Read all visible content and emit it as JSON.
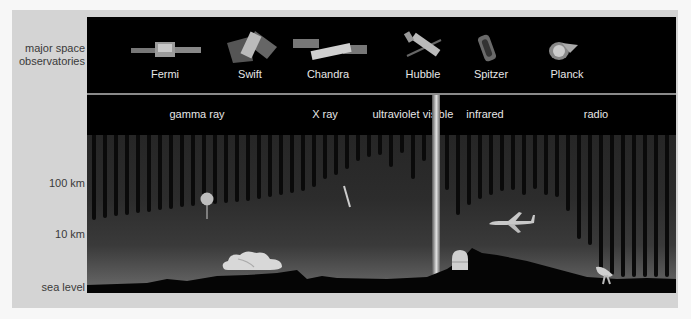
{
  "left_axis": {
    "observatories_label_line1": "major space",
    "observatories_label_line2": "observatories",
    "altitudes": [
      {
        "label": "100 km",
        "y": 184
      },
      {
        "label": "10 km",
        "y": 235
      },
      {
        "label": "sea level",
        "y": 288
      }
    ]
  },
  "observatories": [
    {
      "name": "Fermi",
      "x": 78
    },
    {
      "name": "Swift",
      "x": 163
    },
    {
      "name": "Chandra",
      "x": 241
    },
    {
      "name": "Hubble",
      "x": 336
    },
    {
      "name": "Spitzer",
      "x": 404
    },
    {
      "name": "Planck",
      "x": 480
    }
  ],
  "bands": [
    {
      "name": "gamma ray",
      "x": 110
    },
    {
      "name": "X ray",
      "x": 238
    },
    {
      "name": "ultraviolet",
      "x": 309
    },
    {
      "name": "visible",
      "x": 351
    },
    {
      "name": "infrared",
      "x": 398
    },
    {
      "name": "radio",
      "x": 509
    }
  ],
  "colors": {
    "panel": "#d4d4d4",
    "stage": "#000000",
    "text_light": "#e6e6e6",
    "text_dark": "#3a3a3a"
  }
}
